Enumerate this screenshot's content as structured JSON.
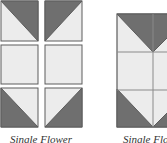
{
  "colors": {
    "dark": "#6f6f6f",
    "light": "#ececec",
    "border": "#5c5c5c",
    "grid_line": "#8a8a8a"
  },
  "left_figure": {
    "label": "Single Flower",
    "layout": "3x2 separated squares",
    "tiles": [
      {
        "row": 1,
        "col": 1,
        "type": "half-square-triangle",
        "dark": "top-right"
      },
      {
        "row": 1,
        "col": 2,
        "type": "half-square-triangle",
        "dark": "top-left"
      },
      {
        "row": 2,
        "col": 1,
        "type": "plain",
        "dark": "none"
      },
      {
        "row": 2,
        "col": 2,
        "type": "plain",
        "dark": "none"
      },
      {
        "row": 3,
        "col": 1,
        "type": "half-square-triangle",
        "dark": "bottom-left"
      },
      {
        "row": 3,
        "col": 2,
        "type": "half-square-triangle",
        "dark": "bottom-right"
      }
    ]
  },
  "right_figure": {
    "label": "Single Flower",
    "layout": "3x2 joined block"
  }
}
